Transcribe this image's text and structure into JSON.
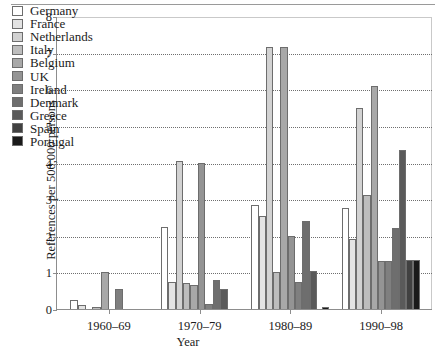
{
  "chart_data": {
    "type": "bar",
    "title": "",
    "xlabel": "Year",
    "ylabel": "References per 500,000 persons",
    "categories": [
      "1960–69",
      "1970–79",
      "1980–89",
      "1990–98"
    ],
    "ylim": [
      0,
      8
    ],
    "yticks": [
      0,
      1,
      2,
      3,
      4,
      5,
      6,
      7,
      8
    ],
    "ytick_labels": [
      "0",
      "1",
      "2",
      "3",
      "4",
      "5",
      "6",
      "7",
      "8"
    ],
    "grid": true,
    "legend_position": "upper left",
    "series": [
      {
        "name": "Germany",
        "color": "#ffffff",
        "values": [
          0.25,
          2.25,
          2.85,
          2.75
        ]
      },
      {
        "name": "France",
        "color": "#e3e3e3",
        "values": [
          0.1,
          0.75,
          2.55,
          1.9
        ]
      },
      {
        "name": "Netherlands",
        "color": "#d2d2d2",
        "values": [
          0.0,
          4.05,
          7.15,
          5.5
        ]
      },
      {
        "name": "Italy",
        "color": "#bdbdbd",
        "values": [
          0.05,
          0.7,
          1.0,
          3.1
        ]
      },
      {
        "name": "Belgium",
        "color": "#a8a8a8",
        "values": [
          1.0,
          0.65,
          7.15,
          6.1
        ]
      },
      {
        "name": "UK",
        "color": "#949494",
        "values": [
          0.0,
          4.0,
          2.0,
          1.3
        ]
      },
      {
        "name": "Ireland",
        "color": "#7f7f7f",
        "values": [
          0.55,
          0.15,
          0.75,
          1.3
        ]
      },
      {
        "name": "Denmark",
        "color": "#6e6e6e",
        "values": [
          0.0,
          0.8,
          2.4,
          2.2
        ]
      },
      {
        "name": "Greece",
        "color": "#5a5a5a",
        "values": [
          0.0,
          0.55,
          1.05,
          4.35
        ]
      },
      {
        "name": "Spain",
        "color": "#414141",
        "values": [
          0.0,
          0.0,
          0.0,
          1.35
        ]
      },
      {
        "name": "Portugal",
        "color": "#1a1a1a",
        "values": [
          0.0,
          0.0,
          0.05,
          1.35
        ]
      }
    ]
  }
}
